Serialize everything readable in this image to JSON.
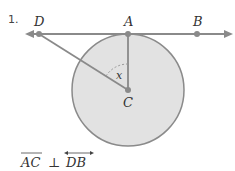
{
  "problem": {
    "number": "1.",
    "points": {
      "D": "D",
      "A": "A",
      "B": "B",
      "C": "C"
    },
    "angle_label": "x",
    "statement": {
      "segment": "AC",
      "perp": "⊥",
      "line": "DB"
    }
  },
  "colors": {
    "line": "#8a8a8a",
    "circle_fill": "#e2e2e2",
    "circle_stroke": "#8a8a8a"
  }
}
